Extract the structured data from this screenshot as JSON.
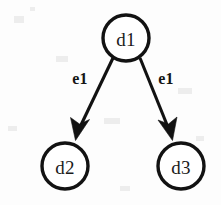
{
  "diagram": {
    "background_color": "#fdfdfd",
    "stroke_color": "#121212",
    "node_fill_color": "#ffffff",
    "nodes": [
      {
        "id": "d1",
        "label": "d1",
        "cx": 126,
        "cy": 38,
        "r": 23
      },
      {
        "id": "d2",
        "label": "d2",
        "cx": 65,
        "cy": 166,
        "r": 23
      },
      {
        "id": "d3",
        "label": "d3",
        "cx": 181,
        "cy": 166,
        "r": 23
      }
    ],
    "edges": [
      {
        "id": "e-d1-d2",
        "label": "e1",
        "from": "d1",
        "to": "d2",
        "label_x": 80,
        "label_y": 78,
        "x1": 113,
        "y1": 58,
        "x2": 79,
        "y2": 129
      },
      {
        "id": "e-d1-d3",
        "label": "e1",
        "from": "d1",
        "to": "d3",
        "label_x": 166,
        "label_y": 78,
        "x1": 140,
        "y1": 58,
        "x2": 168,
        "y2": 129
      }
    ]
  }
}
